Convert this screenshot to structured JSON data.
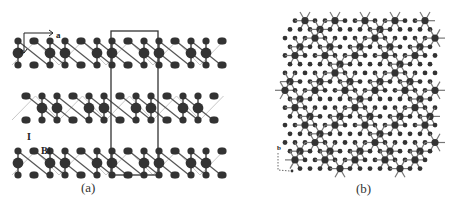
{
  "figure": {
    "panels": [
      {
        "id": "a",
        "caption": "(a)",
        "axes": {
          "horizontal": "a",
          "vertical": "c"
        },
        "atom_labels": {
          "iodine": "I",
          "bismuth": "Bi"
        },
        "unit_cell": {
          "x": 111,
          "y": 31,
          "w": 47,
          "h": 144
        },
        "rows_y": [
          53,
          108,
          163
        ],
        "row_offsets": [
          0,
          -8,
          0
        ],
        "period_x": 47,
        "colors": {
          "atom": "#333333",
          "bond": "#555555",
          "cell": "#333333",
          "zigzag": "#c8c8c8"
        }
      },
      {
        "id": "b",
        "caption": "(b)",
        "axes": {
          "vertical": "b"
        },
        "colors": {
          "atom": "#333333",
          "bond": "#777777"
        }
      }
    ]
  }
}
